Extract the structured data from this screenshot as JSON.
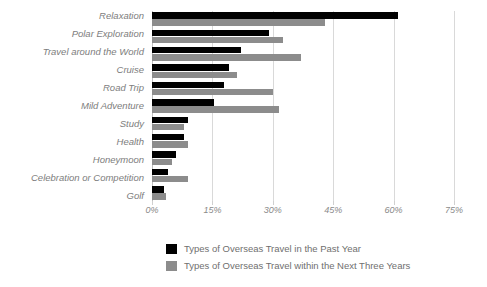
{
  "chart_data": {
    "type": "bar",
    "orientation": "horizontal",
    "title": "",
    "xlabel": "",
    "ylabel": "",
    "xlim": [
      0,
      75
    ],
    "xticks": [
      0,
      15,
      30,
      45,
      60,
      75
    ],
    "xtick_labels": [
      "0%",
      "15%",
      "30%",
      "45%",
      "60%",
      "75%"
    ],
    "grid": true,
    "legend_position": "bottom",
    "categories": [
      "Relaxation",
      "Polar Exploration",
      "Travel around the World",
      "Cruise",
      "Road Trip",
      "Mild Adventure",
      "Study",
      "Health",
      "Honeymoon",
      "Celebration or Competition",
      "Golf"
    ],
    "series": [
      {
        "name": "Types of Overseas Travel in the Past Year",
        "color": "#000000",
        "values": [
          61,
          29,
          22,
          19,
          18,
          15.5,
          9,
          8,
          6,
          4,
          3
        ]
      },
      {
        "name": "Types of Overseas Travel within the Next Three Years",
        "color": "#8c8c8c",
        "values": [
          43,
          32.5,
          37,
          21,
          30,
          31.5,
          8,
          9,
          5,
          9,
          3.5
        ]
      }
    ]
  },
  "legend": {
    "items": [
      {
        "label": "Types of Overseas Travel in the Past Year",
        "color": "#000000"
      },
      {
        "label": "Types of Overseas Travel within the Next Three Years",
        "color": "#8c8c8c"
      }
    ]
  }
}
